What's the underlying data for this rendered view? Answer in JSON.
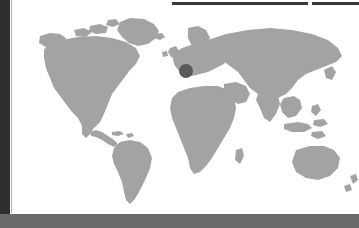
{
  "window": {
    "panel_background": "#ffffff",
    "left_rail_color": "#2e2e2e",
    "bottom_bar_color": "#6a6a6a",
    "toolbar_color": "#3a3a3a"
  },
  "toolbar": {
    "bars": [
      {
        "name": "toolbar-strip-primary",
        "label": ""
      },
      {
        "name": "toolbar-strip-secondary",
        "label": ""
      }
    ]
  },
  "map": {
    "title": "",
    "projection": "equirectangular",
    "land_color": "#a3a3a3",
    "ocean_color": "#ffffff",
    "markers": [
      {
        "name": "location-marker",
        "label": "",
        "region": "Central Europe",
        "color": "#5a5a5a",
        "x_px": 174,
        "y_px": 71,
        "radius_px": 7
      }
    ],
    "continents": [
      "North America",
      "South America",
      "Europe",
      "Africa",
      "Asia",
      "Australia",
      "Greenland"
    ]
  },
  "status_bar": {
    "text": ""
  }
}
